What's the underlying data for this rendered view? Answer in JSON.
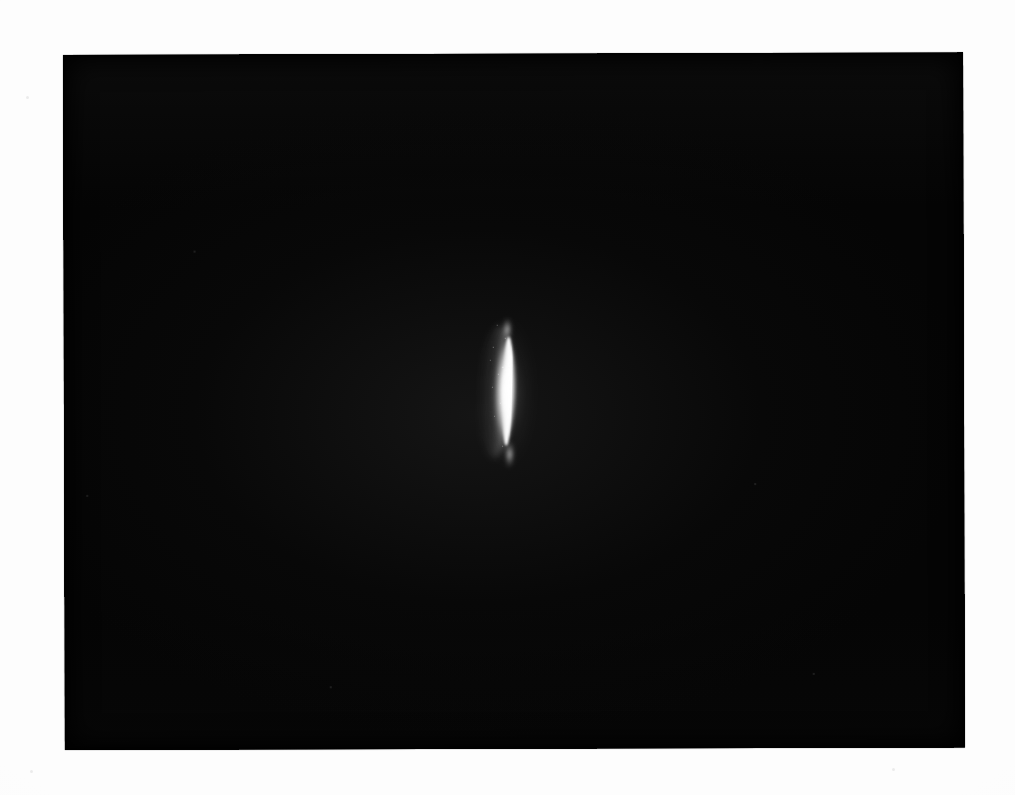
{
  "document": {
    "kind": "scanned-photographic-plate",
    "page_background_color": "#fdfdfd",
    "page_width": 1015,
    "page_height": 795
  },
  "plate": {
    "name": "photographic-plate",
    "background_color": "#050505",
    "left": 63,
    "top": 55,
    "width": 900,
    "height": 695,
    "skew_degrees": -0.16,
    "description": "Near-black rectangular exposure field occupying the centre of the page with white paper margins on all four sides."
  },
  "feature": {
    "name": "bright-crescent-streak",
    "description": "A single narrow, grainy, vertically elongated crescent of bright white light, tapering to points at top and bottom, positioned slightly left of the plate centre.",
    "color": "#ffffff",
    "center_x": 505,
    "center_y": 393,
    "top_y": 330,
    "bottom_y": 458,
    "left_x": 490,
    "right_x": 518,
    "length_px": 128,
    "max_width_px": 28,
    "core_x_range": [
      505,
      513
    ],
    "soft_edge": "left",
    "sharp_edge": "right",
    "tilt_degrees": 1.5
  },
  "margin_marks": [
    {
      "name": "margin-speck-upper-left",
      "x": 26,
      "y": 96,
      "size": 3
    },
    {
      "name": "margin-speck-lower-left",
      "x": 30,
      "y": 770,
      "size": 3
    },
    {
      "name": "margin-speck-lower-right",
      "x": 892,
      "y": 768,
      "size": 3
    }
  ],
  "plate_specks": [
    {
      "name": "plate-speck-a",
      "x": 130,
      "y": 196,
      "size": 2
    },
    {
      "name": "plate-speck-b",
      "x": 22,
      "y": 440,
      "size": 2
    },
    {
      "name": "plate-speck-c",
      "x": 690,
      "y": 430,
      "size": 2
    },
    {
      "name": "plate-speck-d",
      "x": 265,
      "y": 632,
      "size": 2
    },
    {
      "name": "plate-speck-e",
      "x": 748,
      "y": 620,
      "size": 2
    }
  ]
}
